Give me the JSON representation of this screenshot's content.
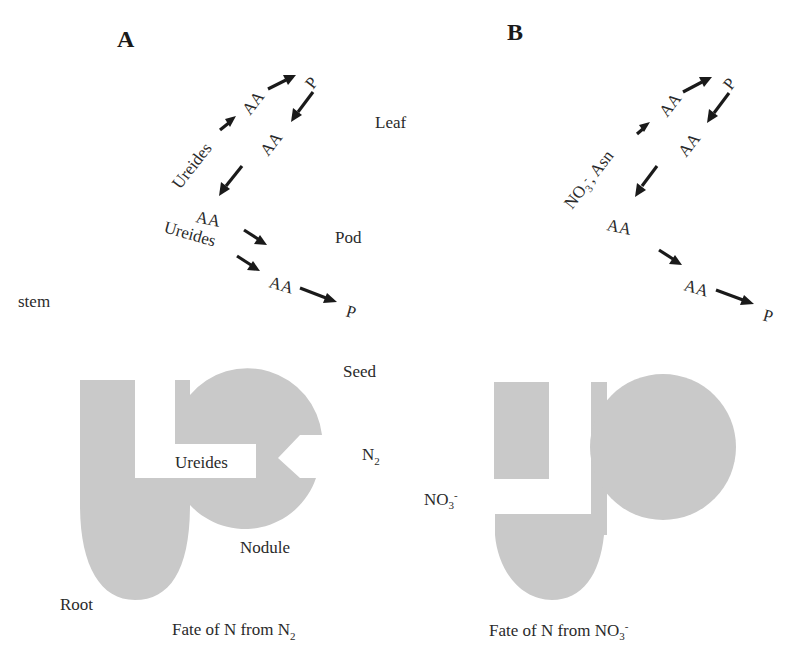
{
  "panels": {
    "A": {
      "letter": "A",
      "organs": {
        "leaf": "Leaf",
        "pod": "Pod",
        "stem": "stem",
        "seed": "Seed",
        "root": "Root",
        "nodule": "Nodule"
      },
      "source": {
        "base": "N",
        "sub": "2",
        "sup": ""
      },
      "channel_label": "Ureides",
      "flow_labels": {
        "leaf_input": "Ureides",
        "pod_input": "Ureides",
        "leaf_aa_1": "AA",
        "leaf_p": "P",
        "leaf_aa_2": "AA",
        "pod_aa": "AA",
        "seed_aa": "AA",
        "seed_p": "P"
      },
      "caption": {
        "text": "Fate of N from N",
        "sub": "2",
        "sup": ""
      },
      "fill_color": "#c9c9c9"
    },
    "B": {
      "letter": "B",
      "source": {
        "base": "NO",
        "sub": "3",
        "sup": "-"
      },
      "flow_labels": {
        "leaf_input_base": "NO",
        "leaf_input_sub": "3",
        "leaf_input_sup": "-",
        "leaf_input_rest": ", Asn",
        "leaf_aa_1": "AA",
        "leaf_p": "P",
        "leaf_aa_2": "AA",
        "pod_aa": "AA",
        "seed_aa": "AA",
        "seed_p": "P"
      },
      "caption": {
        "text": "Fate of N from NO",
        "sub": "3",
        "sup": "-"
      },
      "fill_color": "#c9c9c9"
    }
  },
  "colors": {
    "shape_fill": "#c9c9c9",
    "arrow": "#1a1a1a",
    "text": "#2a2a2a",
    "background": "#ffffff"
  }
}
